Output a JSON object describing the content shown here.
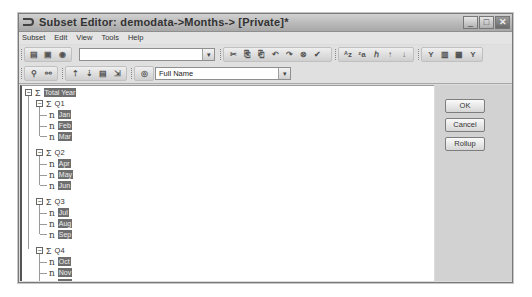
{
  "window": {
    "title": "Subset Editor:  demodata->Months->  [Private]*",
    "controls": {
      "minimize": "_",
      "maximize": "□",
      "close": "✕"
    }
  },
  "menubar": {
    "items": [
      {
        "label": "Subset",
        "mnemonic": "S"
      },
      {
        "label": "Edit",
        "mnemonic": "E"
      },
      {
        "label": "View",
        "mnemonic": "V"
      },
      {
        "label": "Tools",
        "mnemonic": "T"
      },
      {
        "label": "Help",
        "mnemonic": "H"
      }
    ]
  },
  "toolbar1": {
    "subset_combo_value": "",
    "icons": [
      "open-subset-icon",
      "save-icon",
      "settings-icon",
      "cut-icon",
      "copy-icon",
      "paste-icon",
      "undo-icon",
      "redo-icon",
      "delete-icon",
      "keep-icon",
      "sort-asc-icon",
      "sort-desc-icon",
      "sort-hierarchy-icon",
      "sort-index-asc-icon",
      "sort-index-desc-icon",
      "filter-level-icon",
      "filter-attribute-icon",
      "filter-expression-icon",
      "filter-icon"
    ],
    "icon_glyphs": [
      "▤",
      "▣",
      "◉",
      "✂",
      "⎘",
      "⎗",
      "↶",
      "↷",
      "⊗",
      "✔",
      "ᴬz",
      "ᶻa",
      "ℎ",
      "↑",
      "↓",
      "Y",
      "▥",
      "▦",
      "Y"
    ]
  },
  "toolbar2": {
    "icons": [
      "expand-all-icon",
      "collapse-all-icon",
      "drill-up-icon",
      "drill-down-icon",
      "hierarchy-icon",
      "expand-icon",
      "alias-icon"
    ],
    "icon_glyphs": [
      "⚲",
      "⚯",
      "⇡",
      "⇣",
      "▤",
      "⇲",
      "◎"
    ],
    "alias_combo_value": "Full Name"
  },
  "tree": {
    "root": {
      "label": "Total Year",
      "type": "consolidated",
      "expanded": true
    },
    "quarters": [
      {
        "label": "Q1",
        "months": [
          "Jan",
          "Feb",
          "Mar"
        ]
      },
      {
        "label": "Q2",
        "months": [
          "Apr",
          "May",
          "Jun"
        ]
      },
      {
        "label": "Q3",
        "months": [
          "Jul",
          "Aug",
          "Sep"
        ]
      },
      {
        "label": "Q4",
        "months": [
          "Oct",
          "Nov",
          "Dec"
        ]
      }
    ],
    "glyphs": {
      "collapse": "−",
      "sigma": "Σ",
      "leaf": "n"
    }
  },
  "buttons": {
    "ok": "OK",
    "cancel": "Cancel",
    "rollup": "Rollup"
  }
}
